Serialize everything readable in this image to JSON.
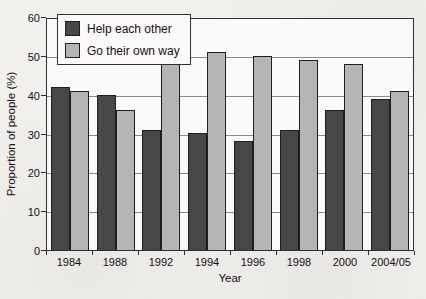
{
  "chart_data": {
    "type": "bar",
    "title": "",
    "categories": [
      "1984",
      "1988",
      "1992",
      "1994",
      "1996",
      "1998",
      "2000",
      "2004/05"
    ],
    "series": [
      {
        "name": "Help each other",
        "color": "#474747",
        "values": [
          42,
          40,
          31,
          30,
          28,
          31,
          36,
          39
        ]
      },
      {
        "name": "Go their own way",
        "color": "#b5b5b5",
        "values": [
          41,
          36,
          49,
          51,
          50,
          49,
          48,
          41
        ]
      }
    ],
    "xlabel": "Year",
    "ylabel": "Proportion of people (%)",
    "ylim": [
      0,
      60
    ],
    "ytick_step": 10,
    "yticks": [
      0,
      10,
      20,
      30,
      40,
      50,
      60
    ],
    "grid": true,
    "legend_position": "top-left-inside",
    "colors": {
      "axis": "#2f2f2f",
      "gridline": "#8b8b8b",
      "plot_background": "#fbfaf8",
      "page_background": "#f1f0ed"
    }
  }
}
